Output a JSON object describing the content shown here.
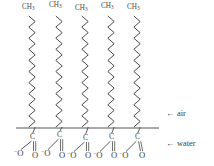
{
  "figure": {
    "type": "chemical-structure-diagram",
    "background_color": "#ffffff",
    "ink_color": "#3c3c3c"
  },
  "interface_line": {
    "label": "air-water interface",
    "x1": 16,
    "x2": 159,
    "y": 128,
    "color": "#555555",
    "width_px": 1
  },
  "phase_labels": [
    {
      "name": "air",
      "arrow": "←",
      "text": "air",
      "x": 168,
      "y": 113
    },
    {
      "name": "water",
      "arrow": "←",
      "text": "water",
      "x": 168,
      "y": 143
    }
  ],
  "molecules": [
    {
      "index": 1,
      "chain_x": 32,
      "tail_label": {
        "element": "C",
        "subscript": "3",
        "text": "CH3",
        "x": 22,
        "y": 4
      },
      "head": {
        "carbon": {
          "text": "C",
          "x": 30,
          "y": 133
        },
        "oxygens": [
          {
            "text": "O",
            "charge": "−",
            "bond": "single",
            "x": 16,
            "y": 149
          },
          {
            "text": "O",
            "charge": "",
            "bond": "double",
            "x": 32,
            "y": 151
          }
        ]
      }
    },
    {
      "index": 2,
      "chain_x": 59,
      "tail_label": {
        "element": "C",
        "subscript": "3",
        "text": "CH3",
        "x": 49,
        "y": 2
      },
      "head": {
        "carbon": {
          "text": "C",
          "x": 57,
          "y": 131
        },
        "oxygens": [
          {
            "text": "O",
            "charge": "−",
            "bond": "single",
            "x": 43,
            "y": 149
          },
          {
            "text": "O",
            "charge": "",
            "bond": "double",
            "x": 59,
            "y": 151
          }
        ]
      }
    },
    {
      "index": 3,
      "chain_x": 85,
      "tail_label": {
        "element": "C",
        "subscript": "3",
        "text": "CH3",
        "x": 75,
        "y": 5
      },
      "head": {
        "carbon": {
          "text": "C",
          "x": 83,
          "y": 134
        },
        "oxygens": [
          {
            "text": "O",
            "charge": "−",
            "bond": "single",
            "x": 69,
            "y": 151
          },
          {
            "text": "O",
            "charge": "",
            "bond": "double",
            "x": 85,
            "y": 151
          }
        ]
      }
    },
    {
      "index": 4,
      "chain_x": 111,
      "tail_label": {
        "element": "C",
        "subscript": "3",
        "text": "CH3",
        "x": 101,
        "y": 3
      },
      "head": {
        "carbon": {
          "text": "C",
          "x": 109,
          "y": 133
        },
        "oxygens": [
          {
            "text": "O",
            "charge": "−",
            "bond": "single",
            "x": 95,
            "y": 151
          },
          {
            "text": "O",
            "charge": "",
            "bond": "double",
            "x": 111,
            "y": 151
          }
        ]
      }
    },
    {
      "index": 5,
      "chain_x": 137,
      "tail_label": {
        "element": "C",
        "subscript": "3",
        "text": "CH3",
        "x": 127,
        "y": 4
      },
      "head": {
        "carbon": {
          "text": "C",
          "x": 135,
          "y": 133
        },
        "oxygens": [
          {
            "text": "O",
            "charge": "−",
            "bond": "single",
            "x": 121,
            "y": 151
          },
          {
            "text": "O",
            "charge": "",
            "bond": "double",
            "x": 139,
            "y": 151
          }
        ]
      }
    }
  ],
  "chain_geometry": {
    "top_y": 16,
    "bottom_y": 127,
    "zigzag_amplitude_px": 3.2,
    "zigzag_segments": 20,
    "stroke_color": "#4a4a4a",
    "stroke_width": 1
  }
}
